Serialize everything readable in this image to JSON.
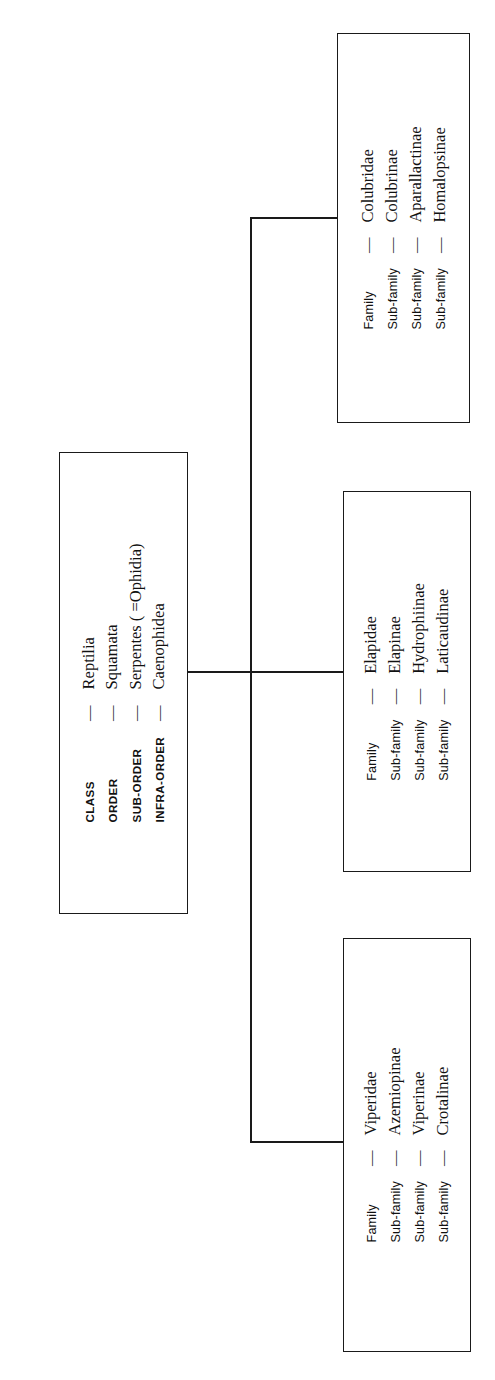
{
  "diagram": {
    "orientation": "text rotated 90 degrees counter-clockwise",
    "line_color": "#1a1a1a",
    "background_color": "#ffffff",
    "dash": "—"
  },
  "central_box": {
    "name": "taxonomic-ranks",
    "rows": [
      {
        "label": "CLASS",
        "dash": "—",
        "value": "Reptilia"
      },
      {
        "label": "ORDER",
        "dash": "—",
        "value": "Squamata"
      },
      {
        "label": "SUB-ORDER",
        "dash": "—",
        "value": "Serpentes ( =Ophidia)"
      },
      {
        "label": "INFRA-ORDER",
        "dash": "—",
        "value": "Caenophidea"
      }
    ]
  },
  "family_boxes": [
    {
      "name": "colubridae-box",
      "rows": [
        {
          "label": "Family",
          "dash": "—",
          "value": "Colubridae"
        },
        {
          "label": "Sub-family",
          "dash": "—",
          "value": "Colubrinae"
        },
        {
          "label": "Sub-family",
          "dash": "—",
          "value": "Aparallactinae"
        },
        {
          "label": "Sub-family",
          "dash": "—",
          "value": "Homalopsinae"
        }
      ]
    },
    {
      "name": "elapidae-box",
      "rows": [
        {
          "label": "Family",
          "dash": "—",
          "value": "Elapidae"
        },
        {
          "label": "Sub-family",
          "dash": "—",
          "value": "Elapinae"
        },
        {
          "label": "Sub-family",
          "dash": "—",
          "value": "Hydrophiinae"
        },
        {
          "label": "Sub-family",
          "dash": "—",
          "value": "Laticaudinae"
        }
      ]
    },
    {
      "name": "viperidae-box",
      "rows": [
        {
          "label": "Family",
          "dash": "—",
          "value": "Viperidae"
        },
        {
          "label": "Sub-family",
          "dash": "—",
          "value": "Azemiopinae"
        },
        {
          "label": "Sub-family",
          "dash": "—",
          "value": "Viperinae"
        },
        {
          "label": "Sub-family",
          "dash": "—",
          "value": "Crotalinae"
        }
      ]
    }
  ]
}
